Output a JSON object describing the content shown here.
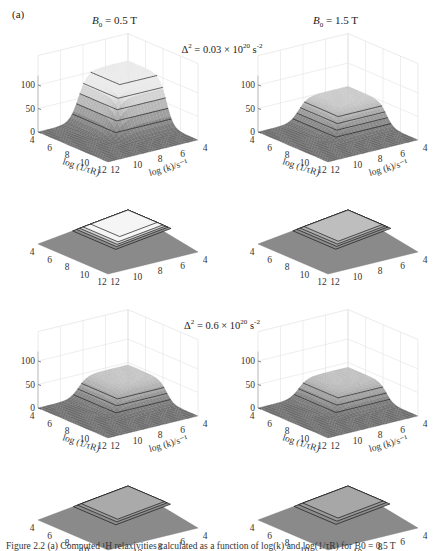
{
  "figure": {
    "panel_label": "(a)",
    "column_titles": [
      {
        "symbol": "B",
        "subscript": "0",
        "rest": " = 0.5 T"
      },
      {
        "symbol": "B",
        "subscript": "0",
        "rest": " = 1.5 T"
      }
    ],
    "row_titles": [
      {
        "prefix": "Δ",
        "sup": "2",
        "mid": " = 0.03 × 10",
        "sup2": "20",
        "suffix": " s",
        "sup3": "-2"
      },
      {
        "prefix": "Δ",
        "sup": "2",
        "mid": " = 0.6 × 10",
        "sup2": "20",
        "suffix": " s",
        "sup3": "-2"
      }
    ],
    "caption_partial": "Figure 2.2   (a) Computed ¹H relaxivities calculated as a function of log(k) and log(1/τR) for B0 = 0.5 T"
  },
  "chart_data": [
    {
      "type": "surface",
      "panel": "top-left",
      "B0": "0.5 T",
      "delta2": "0.03 × 10^20 s^-2",
      "zlim": [
        0,
        120
      ],
      "zticks": [
        "0",
        "50",
        "100"
      ],
      "xticks": [
        "4",
        "6",
        "8",
        "10",
        "12"
      ],
      "yticks": [
        "4",
        "6",
        "8",
        "10",
        "12"
      ],
      "xlabel": "log (1/τR)",
      "ylabel": "log (k)/s⁻¹",
      "peak_value": 105,
      "plateau_region": {
        "log_inv_tauR": [
          4,
          8.5
        ],
        "log_k": [
          4,
          9
        ]
      },
      "contour_levels": [
        20,
        40,
        60,
        80,
        100
      ],
      "has_contour_projection": true
    },
    {
      "type": "surface",
      "panel": "top-right",
      "B0": "1.5 T",
      "delta2": "0.03 × 10^20 s^-2",
      "zlim": [
        0,
        120
      ],
      "zticks": [
        "0",
        "50",
        "100"
      ],
      "xticks": [
        "4",
        "6",
        "8",
        "10",
        "12"
      ],
      "yticks": [
        "4",
        "6",
        "8",
        "10",
        "12"
      ],
      "xlabel": "log (1/τR)",
      "ylabel": "log (k)/s⁻¹",
      "peak_value": 50,
      "plateau_region": {
        "log_inv_tauR": [
          4,
          8.5
        ],
        "log_k": [
          4,
          9
        ]
      },
      "contour_levels": [
        10,
        20,
        30,
        40
      ],
      "has_contour_projection": true
    },
    {
      "type": "surface",
      "panel": "bottom-left",
      "B0": "0.5 T",
      "delta2": "0.6 × 10^20 s^-2",
      "zlim": [
        0,
        120
      ],
      "zticks": [
        "0",
        "50",
        "100"
      ],
      "xticks": [
        "4",
        "6",
        "8",
        "10",
        "12"
      ],
      "yticks": [
        "4",
        "6",
        "8",
        "10",
        "12"
      ],
      "xlabel": "log (1/τR)",
      "ylabel": "log (k)/s⁻¹",
      "peak_value": 45,
      "plateau_region": {
        "log_inv_tauR": [
          4,
          8.5
        ],
        "log_k": [
          4,
          9
        ]
      },
      "contour_levels": [
        10,
        20,
        30
      ],
      "has_contour_projection": true
    },
    {
      "type": "surface",
      "panel": "bottom-right",
      "B0": "1.5 T",
      "delta2": "0.6 × 10^20 s^-2",
      "zlim": [
        0,
        120
      ],
      "zticks": [
        "0",
        "50",
        "100"
      ],
      "xticks": [
        "4",
        "6",
        "8",
        "10",
        "12"
      ],
      "yticks": [
        "4",
        "6",
        "8",
        "10",
        "12"
      ],
      "xlabel": "log (1/τR)",
      "ylabel": "log (k)/s⁻¹",
      "peak_value": 40,
      "plateau_region": {
        "log_inv_tauR": [
          4,
          8.5
        ],
        "log_k": [
          4,
          9
        ]
      },
      "contour_levels": [
        10,
        20,
        30
      ],
      "has_contour_projection": true
    }
  ]
}
